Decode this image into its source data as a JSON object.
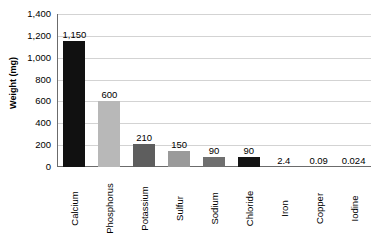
{
  "chart_data": {
    "type": "bar",
    "title": "",
    "xlabel": "",
    "ylabel": "Weight (mg)",
    "categories": [
      "Calcium",
      "Phosphorus",
      "Potassium",
      "Sulfur",
      "Sodium",
      "Chloride",
      "Iron",
      "Copper",
      "Iodine"
    ],
    "values": [
      1150,
      600,
      210,
      150,
      90,
      90,
      2.4,
      0.09,
      0.024
    ],
    "value_labels": [
      "1,150",
      "600",
      "210",
      "150",
      "90",
      "90",
      "2.4",
      "0.09",
      "0.024"
    ],
    "bar_colors": [
      "#111111",
      "#b8b8b8",
      "#5e5e5e",
      "#9a9a9a",
      "#6f6f6f",
      "#141414",
      "#7a7a7a",
      "#7a7a7a",
      "#7a7a7a"
    ],
    "ylim": [
      0,
      1400
    ],
    "yticks": [
      0,
      200,
      400,
      600,
      800,
      1000,
      1200,
      1400
    ],
    "ytick_labels": [
      "0",
      "200",
      "400",
      "600",
      "800",
      "1,000",
      "1,200",
      "1,400"
    ],
    "grid": true,
    "grid_color": "#d3d3d3",
    "legend": "none",
    "axis_color": "#6b6b6b",
    "background": "#ffffff"
  }
}
